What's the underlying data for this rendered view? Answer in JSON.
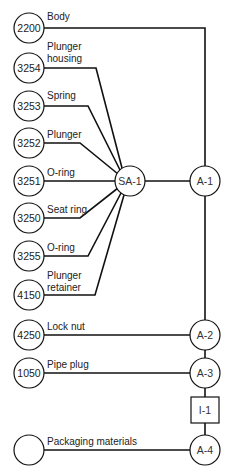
{
  "diagram": {
    "type": "assembly-chart",
    "parts": [
      {
        "id": "p2200",
        "number": "2200",
        "label1": "Body",
        "label2": ""
      },
      {
        "id": "p3254",
        "number": "3254",
        "label1": "Plunger",
        "label2": "housing"
      },
      {
        "id": "p3253",
        "number": "3253",
        "label1": "Spring",
        "label2": ""
      },
      {
        "id": "p3252",
        "number": "3252",
        "label1": "Plunger",
        "label2": ""
      },
      {
        "id": "p3251",
        "number": "3251",
        "label1": "O-ring",
        "label2": ""
      },
      {
        "id": "p3250",
        "number": "3250",
        "label1": "Seat ring",
        "label2": ""
      },
      {
        "id": "p3255",
        "number": "3255",
        "label1": "O-ring",
        "label2": ""
      },
      {
        "id": "p4150",
        "number": "4150",
        "label1": "Plunger",
        "label2": "retainer"
      },
      {
        "id": "p4250",
        "number": "4250",
        "label1": "Lock nut",
        "label2": ""
      },
      {
        "id": "p1050",
        "number": "1050",
        "label1": "Pipe plug",
        "label2": ""
      },
      {
        "id": "ppack",
        "number": "",
        "label1": "Packaging materials",
        "label2": ""
      }
    ],
    "operations": {
      "sa1": "SA-1",
      "a1": "A-1",
      "a2": "A-2",
      "a3": "A-3",
      "i1": "I-1",
      "a4": "A-4"
    },
    "colors": {
      "line": "#111111",
      "background": "#ffffff"
    }
  }
}
